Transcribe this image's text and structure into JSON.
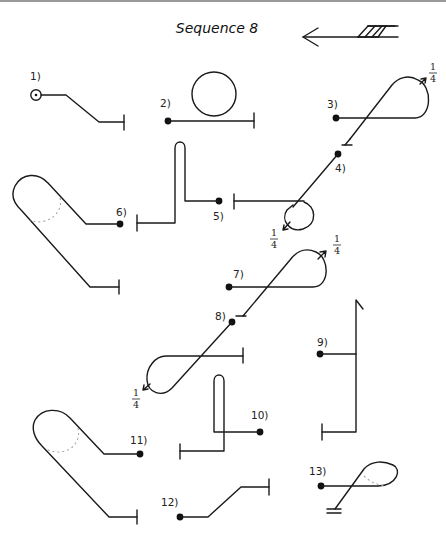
{
  "title": "Sequence 8",
  "direction_arrow": {
    "icon": "direction-arrow-icon",
    "points": "left"
  },
  "steps": [
    {
      "label": "1)",
      "start": "circle-dot"
    },
    {
      "label": "2)",
      "start": "dot",
      "shape": "loop-circle"
    },
    {
      "label": "3)",
      "start": "dot",
      "rotation": "1/4"
    },
    {
      "label": "4)",
      "start": "dot",
      "rotation": "1/4"
    },
    {
      "label": "5)",
      "start": "dot"
    },
    {
      "label": "6)",
      "start": "dot"
    },
    {
      "label": "7)",
      "start": "dot",
      "rotation": "1/4"
    },
    {
      "label": "8)",
      "start": "dot",
      "rotation": "1/4"
    },
    {
      "label": "9)",
      "start": "dot"
    },
    {
      "label": "10)",
      "start": "dot"
    },
    {
      "label": "11)",
      "start": "dot"
    },
    {
      "label": "12)",
      "start": "dot"
    },
    {
      "label": "13)",
      "start": "dot"
    }
  ],
  "fraction": {
    "numerator": "1",
    "denominator": "4"
  }
}
